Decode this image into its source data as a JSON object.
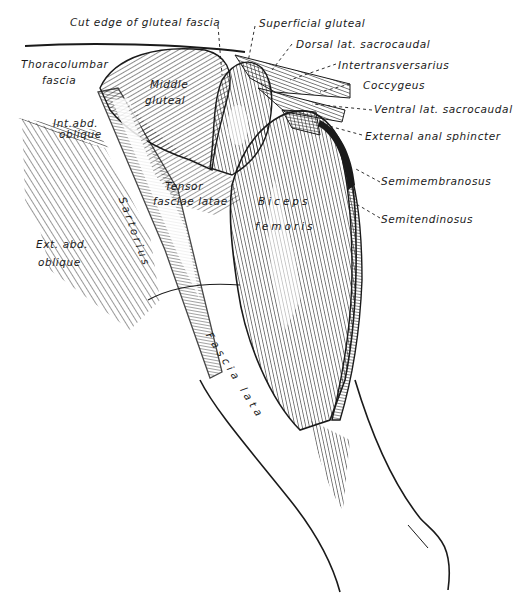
{
  "figure": {
    "type": "anatomical-illustration",
    "ink_color": "#1a1a1a",
    "background_color": "#ffffff"
  },
  "labels": {
    "cut_edge_gluteal_fascia": "Cut edge of gluteal fascia",
    "superficial_gluteal": "Superficial gluteal",
    "dorsal_lat_sacrocaudal": "Dorsal lat. sacrocaudal",
    "intertransversarius": "Intertransversarius",
    "coccygeus": "Coccygeus",
    "ventral_lat_sacrocaudal": "Ventral lat. sacrocaudal",
    "external_anal_sphincter": "External anal sphincter",
    "semimembranosus": "Semimembranosus",
    "semitendinosus": "Semitendinosus",
    "thoracolumbar_fascia_line1": "Thoracolumbar",
    "thoracolumbar_fascia_line2": "fascia",
    "middle_gluteal_line1": "Middle",
    "middle_gluteal_line2": "gluteal",
    "int_abd_oblique_line1": "Int.abd.",
    "int_abd_oblique_line2": "oblique",
    "tensor_fasciae_latae_line1": "Tensor",
    "tensor_fasciae_latae_line2": "fasciae latae",
    "biceps_femoris_line1": "Biceps",
    "biceps_femoris_line2": "femoris",
    "sartorius": "Sartorius",
    "ext_abd_oblique_line1": "Ext. abd.",
    "ext_abd_oblique_line2": "oblique",
    "fascia_lata": "Fascia lata"
  }
}
